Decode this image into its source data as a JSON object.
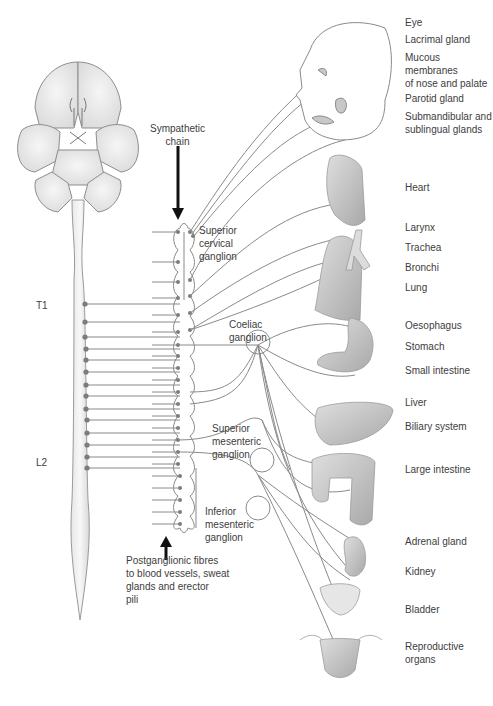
{
  "diagram": {
    "spinal_labels": {
      "top": "T1",
      "bottom": "L2"
    },
    "chain_label": "Sympathetic\nchain",
    "ganglia": {
      "superior_cervical": "Superior\ncervical\nganglion",
      "coeliac": "Coeliac\nganglion",
      "superior_mesenteric": "Superior\nmesenteric\nganglion",
      "inferior_mesenteric": "Inferior\nmesenteric\nganglion"
    },
    "postganglionic_note": "Postganglionic fibres\nto blood vessels, sweat\nglands and erector\npili",
    "organs": [
      {
        "label": "Eye",
        "y": 20
      },
      {
        "label": "Lacrimal gland",
        "y": 38
      },
      {
        "label": "Mucous membranes\nof nose and palate",
        "y": 56
      },
      {
        "label": "Parotid gland",
        "y": 97
      },
      {
        "label": "Submandibular and\nsublingual glands",
        "y": 115
      },
      {
        "label": "Heart",
        "y": 186
      },
      {
        "label": "Larynx",
        "y": 226
      },
      {
        "label": "Trachea",
        "y": 246
      },
      {
        "label": "Bronchi",
        "y": 266
      },
      {
        "label": "Lung",
        "y": 286
      },
      {
        "label": "Oesophagus",
        "y": 323
      },
      {
        "label": "Stomach",
        "y": 343
      },
      {
        "label": "Small intestine",
        "y": 367
      },
      {
        "label": "Liver",
        "y": 399
      },
      {
        "label": "Biliary system",
        "y": 423
      },
      {
        "label": "Large intestine",
        "y": 466
      },
      {
        "label": "Adrenal gland",
        "y": 536
      },
      {
        "label": "Kidney",
        "y": 566
      },
      {
        "label": "Bladder",
        "y": 604
      },
      {
        "label": "Reproductive\norgans",
        "y": 641
      }
    ],
    "colors": {
      "line": "#8a8a8a",
      "organ_fill": "#c9c9c9",
      "brain_fill": "#ededed",
      "dot": "#7c7c7c",
      "arrow": "#111111"
    }
  }
}
